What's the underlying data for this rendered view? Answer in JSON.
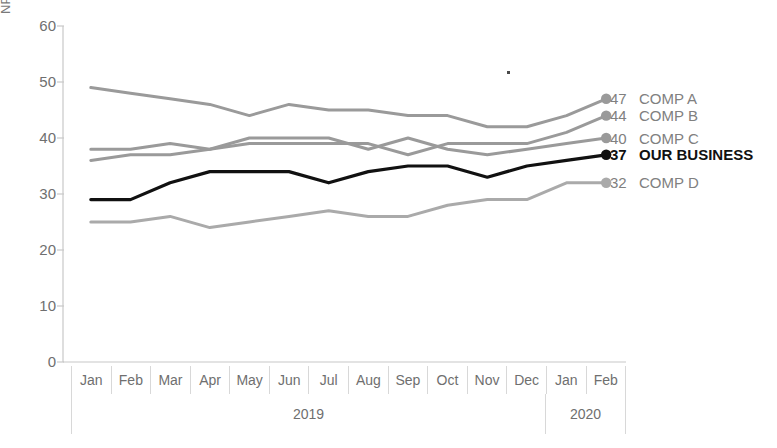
{
  "chart_data": {
    "type": "line",
    "title": "",
    "xlabel": "",
    "ylabel": "NPS",
    "ylim": [
      0,
      60
    ],
    "yticks": [
      0,
      10,
      20,
      30,
      40,
      50,
      60
    ],
    "grid": false,
    "legend_position": "right",
    "x": [
      "Jan",
      "Feb",
      "Mar",
      "Apr",
      "May",
      "Jun",
      "Jul",
      "Aug",
      "Sep",
      "Oct",
      "Nov",
      "Dec",
      "Jan",
      "Feb"
    ],
    "x_groups": [
      {
        "label": "2019",
        "span": 12
      },
      {
        "label": "2020",
        "span": 2
      }
    ],
    "series": [
      {
        "name": "COMP A",
        "end_value": 47,
        "color": "#9a9a9a",
        "highlight": false,
        "values": [
          49,
          48,
          47,
          46,
          44,
          46,
          45,
          45,
          44,
          44,
          42,
          42,
          44,
          47
        ]
      },
      {
        "name": "COMP B",
        "end_value": 44,
        "color": "#9a9a9a",
        "highlight": false,
        "values": [
          38,
          38,
          39,
          38,
          39,
          39,
          39,
          39,
          37,
          39,
          39,
          39,
          41,
          44
        ]
      },
      {
        "name": "COMP C",
        "end_value": 40,
        "color": "#9a9a9a",
        "highlight": false,
        "values": [
          36,
          37,
          37,
          38,
          40,
          40,
          40,
          38,
          40,
          38,
          37,
          38,
          39,
          40
        ]
      },
      {
        "name": "OUR BUSINESS",
        "end_value": 37,
        "color": "#111111",
        "highlight": true,
        "values": [
          29,
          29,
          32,
          34,
          34,
          34,
          32,
          34,
          35,
          35,
          33,
          35,
          36,
          37
        ]
      },
      {
        "name": "COMP D",
        "end_value": 32,
        "color": "#aaaaaa",
        "highlight": false,
        "values": [
          25,
          25,
          26,
          24,
          25,
          26,
          27,
          26,
          26,
          28,
          29,
          29,
          32,
          32
        ]
      }
    ]
  },
  "axis": {
    "y_label": "NPS",
    "y_ticks": [
      "60",
      "50",
      "40",
      "30",
      "20",
      "10",
      "0"
    ]
  },
  "colors": {
    "line_gray": "#9a9a9a",
    "line_black": "#111111",
    "axis_gray": "#c8c8c8",
    "text_gray": "#6f6f6f"
  }
}
